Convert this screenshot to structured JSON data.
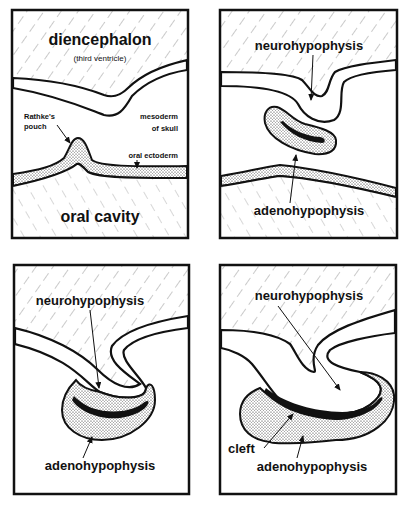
{
  "figure": {
    "panels": [
      {
        "id": "stage-1",
        "labels": {
          "diencephalon": "diencephalon",
          "third_ventricle": "(third ventricle)",
          "rathkes_pouch_1": "Rathke's",
          "rathkes_pouch_2": "pouch",
          "mesoderm_1": "mesoderm",
          "mesoderm_2": "of skull",
          "oral_ectoderm": "oral ectoderm",
          "oral_cavity": "oral cavity"
        }
      },
      {
        "id": "stage-2",
        "labels": {
          "neurohypophysis": "neurohypophysis",
          "adenohypophysis": "adenohypophysis"
        }
      },
      {
        "id": "stage-3",
        "labels": {
          "neurohypophysis": "neurohypophysis",
          "adenohypophysis": "adenohypophysis"
        }
      },
      {
        "id": "stage-4",
        "labels": {
          "neurohypophysis": "neurohypophysis",
          "cleft": "cleft",
          "adenohypophysis": "adenohypophysis"
        }
      }
    ],
    "colors": {
      "ink": "#111111",
      "paper": "#ffffff"
    }
  }
}
